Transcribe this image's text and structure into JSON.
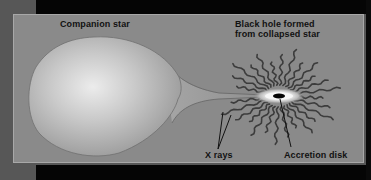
{
  "diagram": {
    "labels": {
      "companion_star": "Companion star",
      "black_hole_line1": "Black hole formed",
      "black_hole_line2": "from collapsed star",
      "x_rays": "X rays",
      "accretion_disk": "Accretion disk"
    },
    "colors": {
      "outer_background": "#575757",
      "frame_black": "#050505",
      "panel": "#8a8a8a",
      "panel_border": "#a8a8a8",
      "star_center": "#e6e6e6",
      "star_edge": "#9c9c9c",
      "ray": "#3c3c3c",
      "text": "#111111"
    },
    "black_hole": {
      "cx": 265,
      "cy": 81
    },
    "rays": {
      "count": 28,
      "inner_radius": 14,
      "outer_radius_min": 44,
      "outer_radius_max": 62,
      "vertical_squash": 0.78
    }
  }
}
